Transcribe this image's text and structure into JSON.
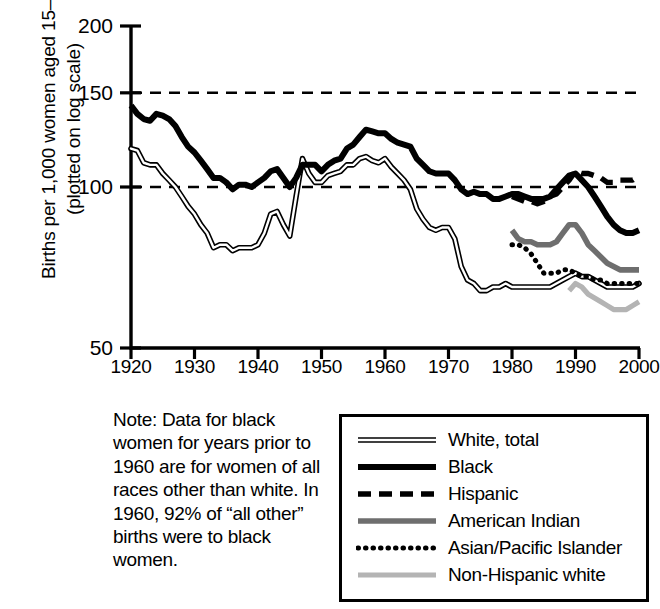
{
  "chart_data": {
    "type": "line",
    "title": "",
    "xlabel": "",
    "ylabel": "Births per 1,000 women aged 15–44 (plotted on log scale)",
    "log_scale": true,
    "xlim": [
      1920,
      2000
    ],
    "ylim": [
      50,
      200
    ],
    "xticks": [
      1920,
      1930,
      1940,
      1950,
      1960,
      1970,
      1980,
      1990,
      2000
    ],
    "yticks": [
      50,
      100,
      150,
      200
    ],
    "gridlines": {
      "horizontal_dashed_at": [
        100,
        150
      ]
    },
    "legend_position": "bottom-right",
    "series": [
      {
        "name": "White, total",
        "style": "thin-double-line",
        "color": "#222222",
        "x": [
          1920,
          1921,
          1922,
          1923,
          1924,
          1925,
          1926,
          1927,
          1928,
          1929,
          1930,
          1931,
          1932,
          1933,
          1934,
          1935,
          1936,
          1937,
          1938,
          1939,
          1940,
          1941,
          1942,
          1943,
          1944,
          1945,
          1946,
          1947,
          1948,
          1949,
          1950,
          1951,
          1952,
          1953,
          1954,
          1955,
          1956,
          1957,
          1958,
          1959,
          1960,
          1961,
          1962,
          1963,
          1964,
          1965,
          1966,
          1967,
          1968,
          1969,
          1970,
          1971,
          1972,
          1973,
          1974,
          1975,
          1976,
          1977,
          1978,
          1979,
          1980,
          1981,
          1982,
          1983,
          1984,
          1985,
          1986,
          1987,
          1988,
          1989,
          1990,
          1991,
          1992,
          1993,
          1994,
          1995,
          1996,
          1997,
          1998,
          1999,
          2000
        ],
        "y": [
          118,
          117,
          111,
          110,
          110,
          106,
          103,
          100,
          96,
          92,
          89,
          85,
          82,
          77,
          78,
          78,
          76,
          77,
          77,
          77,
          78,
          82,
          89,
          90,
          85,
          81,
          96,
          113,
          106,
          102,
          102,
          105,
          106,
          107,
          110,
          110,
          113,
          114,
          112,
          111,
          113,
          109,
          106,
          103,
          99,
          91,
          87,
          84,
          83,
          84,
          84,
          80,
          71,
          67,
          66,
          64,
          64,
          65,
          65,
          66,
          65,
          65,
          65,
          65,
          65,
          65,
          65,
          66,
          67,
          68,
          69,
          68,
          68,
          67,
          66,
          65,
          65,
          65,
          65,
          65,
          66
        ]
      },
      {
        "name": "Black",
        "style": "thick-solid",
        "color": "#000000",
        "x": [
          1920,
          1921,
          1922,
          1923,
          1924,
          1925,
          1926,
          1927,
          1928,
          1929,
          1930,
          1931,
          1932,
          1933,
          1934,
          1935,
          1936,
          1937,
          1938,
          1939,
          1940,
          1941,
          1942,
          1943,
          1944,
          1945,
          1946,
          1947,
          1948,
          1949,
          1950,
          1951,
          1952,
          1953,
          1954,
          1955,
          1956,
          1957,
          1958,
          1959,
          1960,
          1961,
          1962,
          1963,
          1964,
          1965,
          1966,
          1967,
          1968,
          1969,
          1970,
          1971,
          1972,
          1973,
          1974,
          1975,
          1976,
          1977,
          1978,
          1979,
          1980,
          1981,
          1982,
          1983,
          1984,
          1985,
          1986,
          1987,
          1988,
          1989,
          1990,
          1991,
          1992,
          1993,
          1994,
          1995,
          1996,
          1997,
          1998,
          1999,
          2000
        ],
        "y": [
          142,
          137,
          134,
          133,
          137,
          136,
          134,
          130,
          124,
          119,
          116,
          112,
          108,
          104,
          104,
          102,
          99,
          101,
          101,
          100,
          102,
          104,
          107,
          108,
          104,
          100,
          104,
          110,
          110,
          110,
          107,
          110,
          112,
          113,
          118,
          120,
          124,
          128,
          127,
          126,
          126,
          123,
          121,
          120,
          119,
          113,
          110,
          107,
          106,
          106,
          106,
          103,
          99,
          97,
          98,
          97,
          97,
          95,
          95,
          96,
          97,
          97,
          96,
          95,
          95,
          95,
          96,
          99,
          102,
          105,
          106,
          103,
          100,
          96,
          92,
          88,
          85,
          83,
          82,
          82,
          83
        ]
      },
      {
        "name": "Hispanic",
        "style": "dashed",
        "color": "#000000",
        "x": [
          1980,
          1981,
          1982,
          1983,
          1984,
          1985,
          1986,
          1987,
          1988,
          1989,
          1990,
          1991,
          1992,
          1993,
          1994,
          1995,
          1996,
          1997,
          1998,
          1999,
          2000
        ],
        "y": [
          96,
          95,
          94,
          94,
          93,
          94,
          96,
          97,
          100,
          103,
          107,
          106,
          106,
          105,
          104,
          102,
          102,
          103,
          103,
          103,
          105
        ]
      },
      {
        "name": "American Indian",
        "style": "medium-gray-solid",
        "color": "#6e6e6e",
        "x": [
          1980,
          1981,
          1982,
          1983,
          1984,
          1985,
          1986,
          1987,
          1988,
          1989,
          1990,
          1991,
          1992,
          1993,
          1994,
          1995,
          1996,
          1997,
          1998,
          1999,
          2000
        ],
        "y": [
          83,
          80,
          79,
          79,
          78,
          78,
          78,
          79,
          82,
          85,
          85,
          82,
          78,
          76,
          74,
          72,
          71,
          70,
          70,
          70,
          70
        ]
      },
      {
        "name": "Asian/Pacific Islander",
        "style": "dotted",
        "color": "#000000",
        "x": [
          1980,
          1981,
          1982,
          1983,
          1984,
          1985,
          1986,
          1987,
          1988,
          1989,
          1990,
          1991,
          1992,
          1993,
          1994,
          1995,
          1996,
          1997,
          1998,
          1999,
          2000
        ],
        "y": [
          78,
          78,
          77,
          75,
          72,
          69,
          69,
          69,
          70,
          70,
          69,
          68,
          68,
          67,
          67,
          66,
          66,
          66,
          66,
          66,
          66
        ]
      },
      {
        "name": "Non-Hispanic white",
        "style": "light-gray-solid",
        "color": "#b4b4b4",
        "x": [
          1989,
          1990,
          1991,
          1992,
          1993,
          1994,
          1995,
          1996,
          1997,
          1998,
          1999,
          2000
        ],
        "y": [
          64,
          66,
          65,
          63,
          62,
          61,
          60,
          59,
          59,
          59,
          60,
          61
        ]
      }
    ]
  },
  "yaxis": {
    "label": "Births per 1,000 women aged 15–44 (plotted on log scale)",
    "ticks": [
      "200",
      "150",
      "100",
      "50"
    ]
  },
  "xaxis": {
    "ticks": [
      "1920",
      "1930",
      "1940",
      "1950",
      "1960",
      "1970",
      "1980",
      "1990",
      "2000"
    ]
  },
  "note": {
    "text": "Note: Data for black women for years prior to 1960 are for women of all races other than white. In 1960, 92% of “all other” births were to black women."
  },
  "legend": {
    "items": [
      {
        "label": "White, total"
      },
      {
        "label": "Black"
      },
      {
        "label": "Hispanic"
      },
      {
        "label": "American Indian"
      },
      {
        "label": "Asian/Pacific Islander"
      },
      {
        "label": "Non-Hispanic white"
      }
    ]
  }
}
